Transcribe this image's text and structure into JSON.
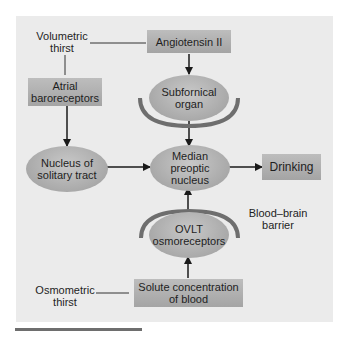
{
  "diagram": {
    "labels": {
      "volumetric_thirst": "Volumetric\nthirst",
      "osmometric_thirst": "Osmometric\nthirst",
      "blood_brain_barrier": "Blood–brain\nbarrier"
    },
    "boxes": {
      "angiotensin": "Angiotensin II",
      "atrial": "Atrial\nbaroreceptors",
      "drinking": "Drinking",
      "solute": "Solute concentration\nof blood"
    },
    "ovals": {
      "subfornical": "Subfornical\norgan",
      "nucleus_solitary": "Nucleus of\nsolitary tract",
      "median_preoptic": "Median\npreoptic\nnucleus",
      "ovlt": "OVLT\nosmoreceptors"
    },
    "colors": {
      "panel": "#ebebeb",
      "box": "#b0b0b0",
      "oval": "#b4b4b4",
      "barrier_arc": "#6e6e6e",
      "arrow": "#1a1a1a"
    }
  }
}
